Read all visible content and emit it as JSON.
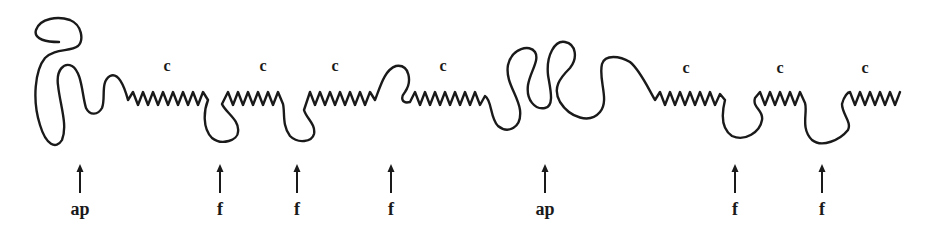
{
  "diagram": {
    "stroke_color": "#1a1a1a",
    "background": "#ffffff",
    "helix_labels": [
      {
        "text": "c",
        "x": 167,
        "y": 60
      },
      {
        "text": "c",
        "x": 263,
        "y": 60
      },
      {
        "text": "c",
        "x": 335,
        "y": 60
      },
      {
        "text": "c",
        "x": 443,
        "y": 60
      },
      {
        "text": "c",
        "x": 686,
        "y": 62
      },
      {
        "text": "c",
        "x": 780,
        "y": 62
      },
      {
        "text": "c",
        "x": 865,
        "y": 62
      }
    ],
    "markers": [
      {
        "label": "ap",
        "x": 80
      },
      {
        "label": "f",
        "x": 220
      },
      {
        "label": "f",
        "x": 297
      },
      {
        "label": "f",
        "x": 391
      },
      {
        "label": "ap",
        "x": 545
      },
      {
        "label": "f",
        "x": 735
      },
      {
        "label": "f",
        "x": 822
      }
    ]
  }
}
